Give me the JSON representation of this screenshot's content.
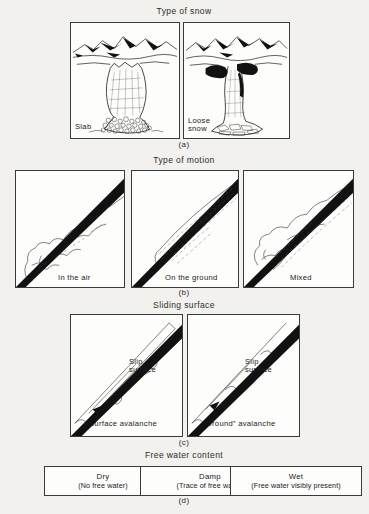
{
  "figure": {
    "background_color": "#f2f1ee",
    "ink_color": "#1a1a1a"
  },
  "sections": [
    {
      "heading": "Type of snow",
      "caption": "(a)",
      "panels": [
        {
          "label": "Slab",
          "name": "slab"
        },
        {
          "label": "Loose\nsnow",
          "name": "loose-snow"
        }
      ]
    },
    {
      "heading": "Type of motion",
      "caption": "(b)",
      "panels": [
        {
          "label": "In the air",
          "name": "in-the-air"
        },
        {
          "label": "On the ground",
          "name": "on-the-ground"
        },
        {
          "label": "Mixed",
          "name": "mixed"
        }
      ]
    },
    {
      "heading": "Sliding surface",
      "caption": "(c)",
      "panels": [
        {
          "label": "Surface avalanche",
          "name": "surface-avalanche",
          "annotation": "Slip\nsurface"
        },
        {
          "label": "“Ground” avalanche",
          "name": "ground-avalanche",
          "annotation": "Slip\nsurface"
        }
      ]
    },
    {
      "heading": "Free water content",
      "caption": "(d)",
      "boxes": [
        {
          "name": "Dry",
          "desc": "(No free water)"
        },
        {
          "name": "Damp",
          "desc": "(Trace of free water)"
        },
        {
          "name": "Wet",
          "desc": "(Free water visibly present)"
        }
      ]
    }
  ]
}
